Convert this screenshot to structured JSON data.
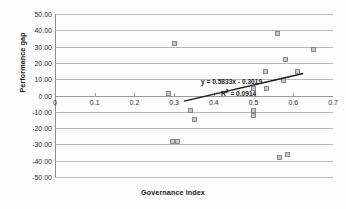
{
  "chart_data": {
    "type": "scatter",
    "title": "",
    "xlabel": "Governance index",
    "ylabel": "Performance gap",
    "xlim": [
      0,
      0.7
    ],
    "ylim": [
      -50,
      50
    ],
    "xticks": [
      "0",
      "0.1",
      "0.2",
      "0.3",
      "0.4",
      "0.5",
      "0.6",
      "0.7"
    ],
    "xtick_values": [
      0,
      0.1,
      0.2,
      0.3,
      0.4,
      0.5,
      0.6,
      0.7
    ],
    "yticks": [
      "50.00",
      "40.00",
      "30.00",
      "20.00",
      "10.00",
      "0.00",
      "-10.00",
      "-20.00",
      "-30.00",
      "-40.00",
      "-50.00"
    ],
    "ytick_values": [
      50,
      40,
      30,
      20,
      10,
      0,
      -10,
      -20,
      -30,
      -40,
      -50
    ],
    "grid": true,
    "legend": "none",
    "marker_color": "#c9c9c9",
    "marker_edge_color": "#8a8a8a",
    "trendline_color": "#1a1a1a",
    "points": [
      {
        "x": 0.285,
        "y": 1
      },
      {
        "x": 0.3,
        "y": 32
      },
      {
        "x": 0.295,
        "y": -28
      },
      {
        "x": 0.308,
        "y": -28
      },
      {
        "x": 0.34,
        "y": -9
      },
      {
        "x": 0.352,
        "y": -15
      },
      {
        "x": 0.5,
        "y": 4
      },
      {
        "x": 0.5,
        "y": -9
      },
      {
        "x": 0.5,
        "y": -12
      },
      {
        "x": 0.53,
        "y": 15
      },
      {
        "x": 0.532,
        "y": 4
      },
      {
        "x": 0.56,
        "y": 38
      },
      {
        "x": 0.565,
        "y": -38
      },
      {
        "x": 0.575,
        "y": 9
      },
      {
        "x": 0.585,
        "y": -36
      },
      {
        "x": 0.58,
        "y": 22
      },
      {
        "x": 0.61,
        "y": 15
      },
      {
        "x": 0.65,
        "y": 28
      }
    ],
    "trendline": {
      "equation": "y = 0.5833x - 0.3019",
      "r_squared_label": "R",
      "r_squared_sup": "2",
      "r_squared_value": " = 0.0914",
      "slope": 0.5833,
      "intercept": -0.3019,
      "x_start": 0.325,
      "x_end": 0.625,
      "y_start": -3.5,
      "y_end": 13.5
    }
  }
}
